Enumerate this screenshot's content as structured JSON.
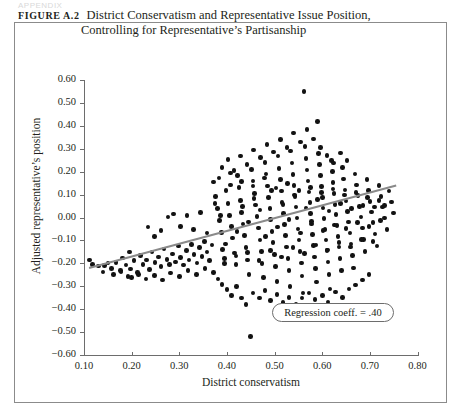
{
  "running_head": "APPENDIX",
  "figure": {
    "label": "Figure A.2",
    "title_line1": "District Conservatism and Representative Issue Position,",
    "title_line2": "Controlling for Representative’s Partisanship"
  },
  "annotation": {
    "text": "Regression coeff. = .40"
  },
  "colors": {
    "dot": "#121212",
    "regression_line": "#8a8a8a",
    "axis": "#6d6d6d",
    "frame": "#8b8b8b"
  },
  "chart_data": {
    "type": "scatter",
    "title": "District Conservatism and Representative Issue Position, Controlling for Representative’s Partisanship",
    "xlabel": "District conservatism",
    "ylabel": "Adjusted representative’s position",
    "xlim": [
      0.1,
      0.8
    ],
    "ylim": [
      -0.6,
      0.6
    ],
    "xticks": [
      0.1,
      0.2,
      0.3,
      0.4,
      0.5,
      0.6,
      0.7,
      0.8
    ],
    "yticks": [
      0.6,
      0.5,
      0.4,
      0.3,
      0.2,
      0.1,
      0.0,
      -0.1,
      -0.2,
      -0.3,
      -0.4,
      -0.5,
      -0.6
    ],
    "xticklabels": [
      "0.10",
      "0.20",
      "0.30",
      "0.40",
      "0.50",
      "0.60",
      "0.70",
      "0.80"
    ],
    "yticklabels": [
      "0.60",
      "0.50",
      "0.40",
      "0.30",
      "0.20",
      "0.10",
      "0.00",
      "−0.10",
      "−0.20",
      "−0.30",
      "−0.40",
      "−0.50",
      "−0.60"
    ],
    "grid": false,
    "legend": false,
    "annotations": [
      {
        "text": "Regression coeff. = .40",
        "x": 0.625,
        "y": -0.415
      }
    ],
    "fit_line": {
      "type": "linear",
      "slope": 0.4,
      "coefficient_label": ".40",
      "x_start": 0.11,
      "y_start": -0.215,
      "x_end": 0.755,
      "y_end": 0.145
    },
    "points": [
      [
        0.112,
        -0.185
      ],
      [
        0.118,
        -0.205
      ],
      [
        0.131,
        -0.212
      ],
      [
        0.143,
        -0.21
      ],
      [
        0.15,
        -0.198
      ],
      [
        0.158,
        -0.222
      ],
      [
        0.167,
        -0.196
      ],
      [
        0.176,
        -0.232
      ],
      [
        0.181,
        -0.176
      ],
      [
        0.188,
        -0.208
      ],
      [
        0.195,
        -0.15
      ],
      [
        0.198,
        -0.224
      ],
      [
        0.205,
        -0.188
      ],
      [
        0.212,
        -0.24
      ],
      [
        0.219,
        -0.165
      ],
      [
        0.224,
        -0.205
      ],
      [
        0.231,
        -0.185
      ],
      [
        0.237,
        -0.228
      ],
      [
        0.243,
        -0.15
      ],
      [
        0.249,
        -0.196
      ],
      [
        0.256,
        -0.172
      ],
      [
        0.262,
        -0.215
      ],
      [
        0.268,
        -0.138
      ],
      [
        0.274,
        -0.182
      ],
      [
        0.28,
        -0.205
      ],
      [
        0.286,
        -0.16
      ],
      [
        0.292,
        -0.195
      ],
      [
        0.298,
        -0.124
      ],
      [
        0.303,
        -0.175
      ],
      [
        0.309,
        -0.208
      ],
      [
        0.315,
        -0.145
      ],
      [
        0.32,
        -0.186
      ],
      [
        0.326,
        -0.118
      ],
      [
        0.331,
        -0.162
      ],
      [
        0.337,
        -0.198
      ],
      [
        0.342,
        -0.132
      ],
      [
        0.348,
        -0.17
      ],
      [
        0.353,
        -0.105
      ],
      [
        0.358,
        -0.15
      ],
      [
        0.363,
        -0.188
      ],
      [
        0.369,
        -0.12
      ],
      [
        0.372,
        0.155
      ],
      [
        0.376,
        0.092
      ],
      [
        0.38,
        0.04
      ],
      [
        0.384,
        -0.012
      ],
      [
        0.388,
        -0.065
      ],
      [
        0.391,
        -0.14
      ],
      [
        0.395,
        -0.178
      ],
      [
        0.398,
        0.118
      ],
      [
        0.402,
        0.062
      ],
      [
        0.405,
        0.008
      ],
      [
        0.409,
        -0.038
      ],
      [
        0.412,
        -0.09
      ],
      [
        0.416,
        -0.155
      ],
      [
        0.419,
        -0.205
      ],
      [
        0.422,
        0.182
      ],
      [
        0.425,
        0.13
      ],
      [
        0.428,
        0.075
      ],
      [
        0.431,
        0.022
      ],
      [
        0.434,
        -0.028
      ],
      [
        0.437,
        -0.078
      ],
      [
        0.44,
        -0.13
      ],
      [
        0.443,
        -0.185
      ],
      [
        0.446,
        -0.25
      ],
      [
        0.449,
        -0.52
      ],
      [
        0.452,
        0.21
      ],
      [
        0.455,
        0.16
      ],
      [
        0.458,
        0.105
      ],
      [
        0.46,
        0.055
      ],
      [
        0.463,
        0.005
      ],
      [
        0.466,
        -0.045
      ],
      [
        0.469,
        -0.098
      ],
      [
        0.472,
        -0.148
      ],
      [
        0.474,
        -0.2
      ],
      [
        0.477,
        -0.262
      ],
      [
        0.48,
        0.24
      ],
      [
        0.482,
        0.19
      ],
      [
        0.485,
        0.138
      ],
      [
        0.487,
        0.088
      ],
      [
        0.49,
        0.038
      ],
      [
        0.492,
        -0.01
      ],
      [
        0.495,
        -0.06
      ],
      [
        0.497,
        -0.11
      ],
      [
        0.5,
        -0.162
      ],
      [
        0.502,
        -0.215
      ],
      [
        0.505,
        -0.278
      ],
      [
        0.507,
        0.268
      ],
      [
        0.509,
        0.215
      ],
      [
        0.512,
        0.165
      ],
      [
        0.514,
        0.115
      ],
      [
        0.516,
        0.065
      ],
      [
        0.519,
        0.018
      ],
      [
        0.521,
        -0.03
      ],
      [
        0.523,
        -0.078
      ],
      [
        0.525,
        -0.128
      ],
      [
        0.528,
        -0.178
      ],
      [
        0.53,
        -0.232
      ],
      [
        0.532,
        -0.3
      ],
      [
        0.534,
        0.29
      ],
      [
        0.537,
        0.238
      ],
      [
        0.539,
        0.188
      ],
      [
        0.541,
        0.14
      ],
      [
        0.543,
        0.092
      ],
      [
        0.545,
        0.045
      ],
      [
        0.547,
        -0.002
      ],
      [
        0.549,
        -0.05
      ],
      [
        0.551,
        -0.098
      ],
      [
        0.553,
        -0.148
      ],
      [
        0.556,
        -0.198
      ],
      [
        0.558,
        -0.255
      ],
      [
        0.56,
        -0.33
      ],
      [
        0.562,
        0.55
      ],
      [
        0.564,
        0.31
      ],
      [
        0.566,
        0.258
      ],
      [
        0.568,
        0.208
      ],
      [
        0.57,
        0.16
      ],
      [
        0.572,
        0.112
      ],
      [
        0.574,
        0.065
      ],
      [
        0.576,
        0.018
      ],
      [
        0.578,
        -0.028
      ],
      [
        0.58,
        -0.075
      ],
      [
        0.582,
        -0.122
      ],
      [
        0.584,
        -0.172
      ],
      [
        0.586,
        -0.222
      ],
      [
        0.588,
        -0.282
      ],
      [
        0.59,
        0.42
      ],
      [
        0.592,
        0.28
      ],
      [
        0.594,
        0.23
      ],
      [
        0.596,
        0.182
      ],
      [
        0.598,
        0.135
      ],
      [
        0.6,
        0.088
      ],
      [
        0.602,
        0.042
      ],
      [
        0.604,
        -0.005
      ],
      [
        0.606,
        -0.052
      ],
      [
        0.608,
        -0.098
      ],
      [
        0.61,
        -0.145
      ],
      [
        0.612,
        -0.195
      ],
      [
        0.614,
        -0.248
      ],
      [
        0.616,
        -0.312
      ],
      [
        0.619,
        0.25
      ],
      [
        0.621,
        0.2
      ],
      [
        0.623,
        0.152
      ],
      [
        0.625,
        0.105
      ],
      [
        0.627,
        0.058
      ],
      [
        0.629,
        0.012
      ],
      [
        0.631,
        -0.035
      ],
      [
        0.633,
        -0.082
      ],
      [
        0.635,
        -0.128
      ],
      [
        0.637,
        -0.178
      ],
      [
        0.64,
        -0.232
      ],
      [
        0.643,
        0.218
      ],
      [
        0.645,
        0.168
      ],
      [
        0.648,
        0.12
      ],
      [
        0.65,
        0.072
      ],
      [
        0.653,
        0.026
      ],
      [
        0.655,
        -0.02
      ],
      [
        0.658,
        -0.068
      ],
      [
        0.66,
        -0.115
      ],
      [
        0.663,
        -0.165
      ],
      [
        0.666,
        -0.22
      ],
      [
        0.669,
        0.19
      ],
      [
        0.672,
        0.142
      ],
      [
        0.675,
        0.095
      ],
      [
        0.678,
        0.048
      ],
      [
        0.681,
        0.002
      ],
      [
        0.684,
        -0.045
      ],
      [
        0.687,
        -0.095
      ],
      [
        0.69,
        -0.148
      ],
      [
        0.694,
        0.165
      ],
      [
        0.697,
        0.118
      ],
      [
        0.7,
        0.07
      ],
      [
        0.704,
        0.024
      ],
      [
        0.707,
        -0.022
      ],
      [
        0.711,
        -0.072
      ],
      [
        0.715,
        -0.125
      ],
      [
        0.719,
        0.14
      ],
      [
        0.723,
        0.092
      ],
      [
        0.727,
        0.045
      ],
      [
        0.731,
        -0.002
      ],
      [
        0.736,
        -0.052
      ],
      [
        0.74,
        0.115
      ],
      [
        0.745,
        0.068
      ],
      [
        0.75,
        0.02
      ],
      [
        0.372,
        -0.24
      ],
      [
        0.381,
        -0.268
      ],
      [
        0.39,
        -0.292
      ],
      [
        0.4,
        -0.315
      ],
      [
        0.41,
        -0.34
      ],
      [
        0.42,
        -0.3
      ],
      [
        0.43,
        -0.352
      ],
      [
        0.44,
        -0.38
      ],
      [
        0.455,
        -0.33
      ],
      [
        0.468,
        -0.352
      ],
      [
        0.48,
        -0.318
      ],
      [
        0.492,
        -0.362
      ],
      [
        0.505,
        -0.335
      ],
      [
        0.518,
        -0.372
      ],
      [
        0.53,
        -0.348
      ],
      [
        0.545,
        -0.378
      ],
      [
        0.558,
        -0.352
      ],
      [
        0.572,
        -0.33
      ],
      [
        0.585,
        -0.358
      ],
      [
        0.6,
        -0.34
      ],
      [
        0.612,
        -0.368
      ],
      [
        0.628,
        -0.325
      ],
      [
        0.642,
        -0.348
      ],
      [
        0.656,
        -0.312
      ],
      [
        0.67,
        -0.295
      ],
      [
        0.684,
        -0.272
      ],
      [
        0.698,
        -0.25
      ],
      [
        0.39,
        0.218
      ],
      [
        0.402,
        0.252
      ],
      [
        0.415,
        0.205
      ],
      [
        0.428,
        0.268
      ],
      [
        0.442,
        0.232
      ],
      [
        0.456,
        0.295
      ],
      [
        0.47,
        0.262
      ],
      [
        0.484,
        0.318
      ],
      [
        0.498,
        0.285
      ],
      [
        0.512,
        0.34
      ],
      [
        0.526,
        0.305
      ],
      [
        0.54,
        0.368
      ],
      [
        0.554,
        0.33
      ],
      [
        0.568,
        0.385
      ],
      [
        0.582,
        0.342
      ],
      [
        0.596,
        0.305
      ],
      [
        0.61,
        0.27
      ],
      [
        0.624,
        0.238
      ],
      [
        0.638,
        0.282
      ],
      [
        0.652,
        0.248
      ],
      [
        0.2,
        -0.262
      ],
      [
        0.215,
        -0.248
      ],
      [
        0.23,
        -0.268
      ],
      [
        0.248,
        -0.252
      ],
      [
        0.265,
        -0.272
      ],
      [
        0.282,
        -0.242
      ],
      [
        0.3,
        -0.258
      ],
      [
        0.318,
        -0.232
      ],
      [
        0.336,
        -0.25
      ],
      [
        0.354,
        -0.222
      ],
      [
        0.162,
        -0.25
      ],
      [
        0.178,
        -0.238
      ],
      [
        0.192,
        -0.258
      ],
      [
        0.14,
        -0.238
      ],
      [
        0.375,
        0.062
      ],
      [
        0.386,
        0.01
      ],
      [
        0.397,
        -0.115
      ],
      [
        0.408,
        0.142
      ],
      [
        0.421,
        -0.062
      ],
      [
        0.433,
        0.048
      ],
      [
        0.445,
        -0.02
      ],
      [
        0.457,
        0.082
      ],
      [
        0.469,
        0.032
      ],
      [
        0.481,
        -0.082
      ],
      [
        0.493,
        0.118
      ],
      [
        0.506,
        -0.042
      ],
      [
        0.518,
        0.058
      ],
      [
        0.53,
        -0.008
      ],
      [
        0.542,
        0.098
      ],
      [
        0.554,
        -0.068
      ],
      [
        0.566,
        0.042
      ],
      [
        0.578,
        -0.018
      ],
      [
        0.59,
        0.078
      ],
      [
        0.602,
        -0.058
      ],
      [
        0.614,
        0.028
      ],
      [
        0.626,
        -0.032
      ],
      [
        0.638,
        0.062
      ],
      [
        0.65,
        -0.048
      ],
      [
        0.662,
        0.038
      ],
      [
        0.674,
        -0.022
      ],
      [
        0.686,
        0.052
      ],
      [
        0.698,
        -0.038
      ],
      [
        0.71,
        0.045
      ],
      [
        0.722,
        -0.012
      ],
      [
        0.383,
        0.172
      ],
      [
        0.395,
        -0.2
      ],
      [
        0.407,
        0.195
      ],
      [
        0.419,
        -0.168
      ],
      [
        0.431,
        0.158
      ],
      [
        0.443,
        -0.152
      ],
      [
        0.455,
        0.138
      ],
      [
        0.467,
        -0.188
      ],
      [
        0.479,
        0.172
      ],
      [
        0.491,
        -0.145
      ],
      [
        0.503,
        0.128
      ],
      [
        0.515,
        -0.172
      ],
      [
        0.527,
        0.148
      ],
      [
        0.539,
        -0.132
      ],
      [
        0.551,
        0.118
      ],
      [
        0.563,
        -0.158
      ],
      [
        0.575,
        0.132
      ],
      [
        0.587,
        -0.12
      ],
      [
        0.599,
        0.108
      ],
      [
        0.611,
        -0.142
      ],
      [
        0.623,
        0.125
      ],
      [
        0.635,
        -0.108
      ],
      [
        0.647,
        0.098
      ],
      [
        0.659,
        -0.128
      ],
      [
        0.671,
        0.108
      ],
      [
        0.683,
        -0.095
      ],
      [
        0.695,
        0.088
      ],
      [
        0.707,
        -0.105
      ],
      [
        0.719,
        0.075
      ],
      [
        0.731,
        0.052
      ],
      [
        0.288,
        0.015
      ],
      [
        0.302,
        -0.038
      ],
      [
        0.316,
        0.008
      ],
      [
        0.33,
        -0.052
      ],
      [
        0.344,
        0.022
      ],
      [
        0.358,
        -0.068
      ],
      [
        0.262,
        -0.058
      ],
      [
        0.276,
        0.002
      ],
      [
        0.248,
        -0.082
      ],
      [
        0.234,
        -0.042
      ]
    ]
  }
}
